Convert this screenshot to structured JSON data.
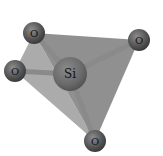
{
  "diagram": {
    "atoms": [
      {
        "id": "o-top-left",
        "label": "O",
        "x": 34,
        "y": 33,
        "r": 11
      },
      {
        "id": "o-left",
        "label": "O",
        "x": 15,
        "y": 71,
        "r": 11
      },
      {
        "id": "si-center",
        "label": "Si",
        "x": 70,
        "y": 74,
        "r": 17
      },
      {
        "id": "o-right",
        "label": "O",
        "x": 139,
        "y": 40,
        "r": 11
      },
      {
        "id": "o-bottom",
        "label": "O",
        "x": 95,
        "y": 141,
        "r": 11
      }
    ],
    "colors": {
      "face_dark": "#7a7a7a",
      "face_light": "#a8a8a8",
      "bond": "#8c8c8c",
      "atom": "#555555",
      "atom_highlight": "#8a8a8a"
    }
  }
}
